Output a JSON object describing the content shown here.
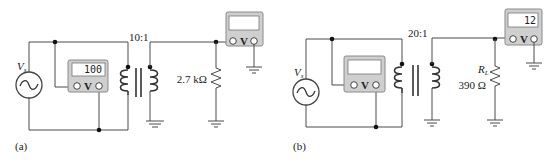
{
  "figure": {
    "panels": [
      {
        "id": "a",
        "caption": "(a)",
        "source_label": "V",
        "source_sub": "s",
        "turns_ratio": "10:1",
        "primary_meter": {
          "reading": "100",
          "symbol": "V"
        },
        "secondary_meter": {
          "reading": "",
          "symbol": "V"
        },
        "load_label": "",
        "load_value": "2.7 kΩ"
      },
      {
        "id": "b",
        "caption": "(b)",
        "source_label": "V",
        "source_sub": "s",
        "turns_ratio": "20:1",
        "primary_meter": {
          "reading": "",
          "symbol": "V"
        },
        "secondary_meter": {
          "reading": "12",
          "symbol": "V"
        },
        "load_label": "R",
        "load_label_sub": "L",
        "load_value": "390 Ω"
      }
    ]
  }
}
